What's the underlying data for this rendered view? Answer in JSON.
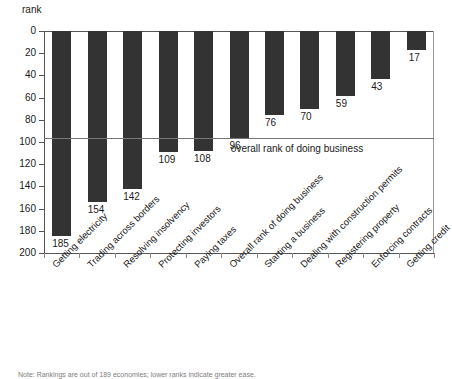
{
  "chart_data": {
    "type": "bar",
    "title": "",
    "xlabel": "",
    "ylabel": "rank",
    "ylim": [
      0,
      200
    ],
    "y_inverted": true,
    "grid": false,
    "legend": "none",
    "categories": [
      "Getting electricity",
      "Trading across borders",
      "Resolving insolvency",
      "Protecting investors",
      "Paying taxes",
      "Overall rank of doing business",
      "Starting a business",
      "Dealing with construction permits",
      "Registering property",
      "Enforcing contracts",
      "Getting credit"
    ],
    "values": [
      185,
      154,
      142,
      109,
      108,
      96,
      76,
      70,
      59,
      43,
      17
    ],
    "value_labels": [
      "185",
      "154",
      "142",
      "109",
      "108",
      "96",
      "76",
      "70",
      "59",
      "43",
      "17"
    ],
    "yticks": [
      0,
      20,
      40,
      60,
      80,
      100,
      120,
      140,
      160,
      180,
      200
    ],
    "ytick_labels": [
      "0",
      "20",
      "40",
      "60",
      "80",
      "100",
      "120",
      "140",
      "160",
      "180",
      "200"
    ],
    "annotations": [
      {
        "name": "overall-rank-reference-line",
        "label": "overall rank of doing business",
        "value": 96,
        "type": "hline"
      }
    ],
    "bar_color": "#333333",
    "axis_color": "#555555",
    "reference_line_color": "#777777",
    "background": "#ffffff"
  },
  "note": {
    "text": "Note: Rankings are out of 189 economies; lower ranks indicate greater ease."
  }
}
